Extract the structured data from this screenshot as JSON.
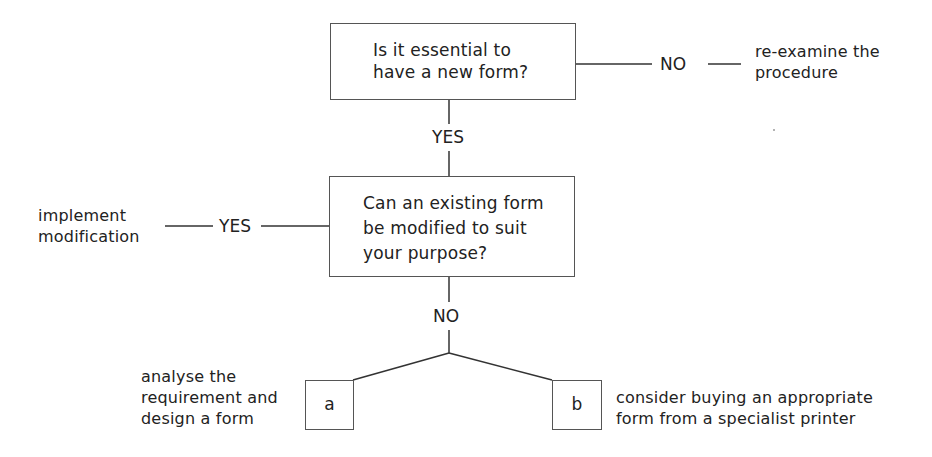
{
  "diagram": {
    "type": "flowchart",
    "nodes": {
      "q1": {
        "text_lines": [
          "Is it essential to",
          "have a new form?"
        ]
      },
      "q2": {
        "text_lines": [
          "Can an existing form",
          "be modified to suit",
          "your purpose?"
        ]
      },
      "box_a": {
        "letter": "a"
      },
      "box_b": {
        "letter": "b"
      }
    },
    "edge_labels": {
      "q1_no": "NO",
      "q1_yes": "YES",
      "q2_yes": "YES",
      "q2_no": "NO"
    },
    "outcomes": {
      "reexamine": [
        "re-examine the",
        "procedure"
      ],
      "implement": [
        "implement",
        "modification"
      ],
      "analyse": [
        "analyse the",
        "requirement and",
        "design a form"
      ],
      "consider": [
        "consider buying an appropriate",
        "form from a specialist printer"
      ]
    },
    "colors": {
      "line": "#333333",
      "box_border": "#555555",
      "text": "#222222",
      "background": "#ffffff"
    }
  }
}
